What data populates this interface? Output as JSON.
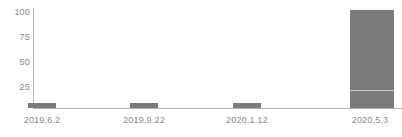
{
  "chart_data": {
    "type": "bar",
    "title": "",
    "subtitle": "",
    "xlabel": "",
    "ylabel": "",
    "categories": [
      "2019.6.2",
      "2019.9.22",
      "2020.1.12",
      "2020.5.3"
    ],
    "values": [
      5,
      5,
      5,
      98
    ],
    "series": [
      {
        "name": "",
        "values": [
          5,
          5,
          5,
          98
        ]
      }
    ],
    "stacked_segments": {
      "2020.5.3": [
        17,
        81
      ]
    },
    "ylim": [
      0,
      100
    ],
    "yticks": [
      25,
      50,
      75,
      100
    ],
    "ytick_labels": [
      "25",
      "50",
      "75",
      "100"
    ],
    "xtick_labels": [
      "2019.6.2",
      "2019.9.22",
      "2020.1.12",
      "2020.5.3"
    ],
    "grid": false,
    "legend": null,
    "legend_position": "none",
    "bar_color": "#7b7b7b",
    "axis_color": "#b5b5b5",
    "tick_label_color": "#8a8a8a",
    "background": "#ffffff"
  },
  "axis": {
    "y_labels": [
      {
        "text": "100",
        "value": 100
      },
      {
        "text": "75",
        "value": 75
      },
      {
        "text": "50",
        "value": 50
      },
      {
        "text": "25",
        "value": 25
      }
    ],
    "x_labels": [
      {
        "text": "2019.6.2"
      },
      {
        "text": "2019.9.22"
      },
      {
        "text": "2020.1.12"
      },
      {
        "text": "2020.5.3"
      }
    ]
  },
  "bars": [
    {
      "label": "2019.6.2",
      "value": 5
    },
    {
      "label": "2019.9.22",
      "value": 5
    },
    {
      "label": "2020.1.12",
      "value": 5
    },
    {
      "label": "2020.5.3",
      "value": 98
    }
  ]
}
